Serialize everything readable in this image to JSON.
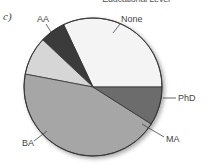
{
  "panel_label": "c)",
  "chart_data": {
    "type": "pie",
    "title": "Educational Level",
    "categories": [
      "None",
      "PhD",
      "MA",
      "BA",
      "AA"
    ],
    "values": [
      32,
      6,
      9,
      44,
      9
    ],
    "unit": "percent (estimated from slice angles)",
    "colors": {
      "None": "#f4f4f4",
      "PhD": "#3a3a3a",
      "MA": "#d6d6d6",
      "BA": "#a6a6a6",
      "AA": "#6c6c6c"
    },
    "start_angle_deg": 0,
    "direction": "counterclockwise from 3 o'clock",
    "legend": "none (direct labels with leader lines)"
  }
}
